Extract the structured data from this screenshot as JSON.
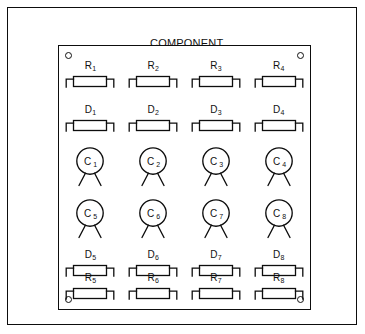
{
  "diagram": {
    "title_lines": [
      "COMPONENT",
      "SIDE"
    ],
    "title_line_1": "COMPONENT",
    "title_line_2": "SIDE",
    "board_name": "printed-circuit-board",
    "mounting_holes": 4,
    "stroke_color": "#0d0d0d",
    "background_color": "#ffffff"
  },
  "grid": {
    "columns": 4,
    "rows": 6,
    "rows_data": [
      {
        "row_id": "resistors-top",
        "component_type": "resistor",
        "symbol": "axial-body",
        "cells": [
          {
            "prefix": "R",
            "index": "1"
          },
          {
            "prefix": "R",
            "index": "2"
          },
          {
            "prefix": "R",
            "index": "3"
          },
          {
            "prefix": "R",
            "index": "4"
          }
        ]
      },
      {
        "row_id": "diodes-top",
        "component_type": "diode",
        "symbol": "axial-body",
        "cells": [
          {
            "prefix": "D",
            "index": "1"
          },
          {
            "prefix": "D",
            "index": "2"
          },
          {
            "prefix": "D",
            "index": "3"
          },
          {
            "prefix": "D",
            "index": "4"
          }
        ]
      },
      {
        "row_id": "capacitors-upper",
        "component_type": "capacitor",
        "symbol": "round-can-two-leads",
        "cells": [
          {
            "prefix": "C",
            "index": "1"
          },
          {
            "prefix": "C",
            "index": "2"
          },
          {
            "prefix": "C",
            "index": "3"
          },
          {
            "prefix": "C",
            "index": "4"
          }
        ]
      },
      {
        "row_id": "capacitors-lower",
        "component_type": "capacitor",
        "symbol": "round-can-two-leads",
        "cells": [
          {
            "prefix": "C",
            "index": "5"
          },
          {
            "prefix": "C",
            "index": "6"
          },
          {
            "prefix": "C",
            "index": "7"
          },
          {
            "prefix": "C",
            "index": "8"
          }
        ]
      },
      {
        "row_id": "diodes-bottom",
        "component_type": "diode",
        "symbol": "axial-body",
        "cells": [
          {
            "prefix": "D",
            "index": "5"
          },
          {
            "prefix": "D",
            "index": "6"
          },
          {
            "prefix": "D",
            "index": "7"
          },
          {
            "prefix": "D",
            "index": "8"
          }
        ]
      },
      {
        "row_id": "resistors-bottom",
        "component_type": "resistor",
        "symbol": "axial-body",
        "cells": [
          {
            "prefix": "R",
            "index": "5"
          },
          {
            "prefix": "R",
            "index": "6"
          },
          {
            "prefix": "R",
            "index": "7"
          },
          {
            "prefix": "R",
            "index": "8"
          }
        ]
      }
    ]
  }
}
